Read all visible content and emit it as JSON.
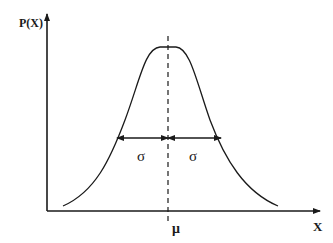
{
  "diagram": {
    "type": "normal-distribution-curve",
    "y_axis_label": "P(X)",
    "x_axis_label": "X",
    "mean_label": "μ",
    "sigma_left_label": "σ",
    "sigma_right_label": "σ",
    "colors": {
      "stroke": "#1a1a1a",
      "background": "#ffffff"
    }
  }
}
